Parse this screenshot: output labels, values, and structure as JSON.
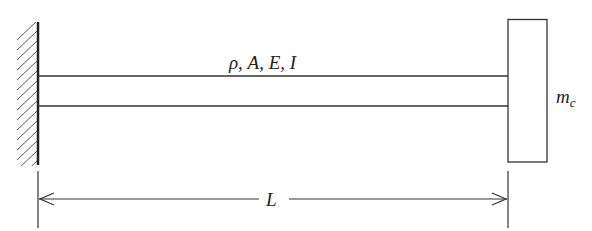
{
  "diagram": {
    "beam_properties_label": "ρ, A, E, I",
    "tip_mass_label": "m",
    "tip_mass_subscript": "c",
    "length_label": "L",
    "colors": {
      "stroke": "#333333",
      "background": "#ffffff"
    }
  }
}
